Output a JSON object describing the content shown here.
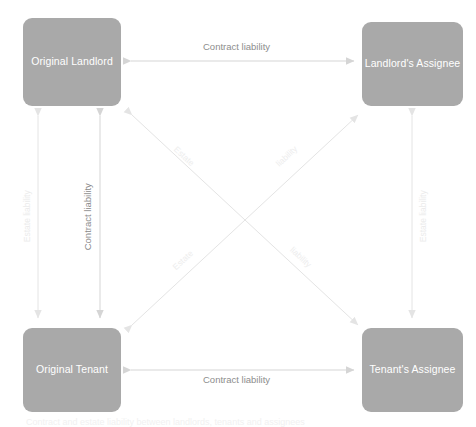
{
  "diagram": {
    "title": "Contract and estate liability between landlords, tenants and assignees",
    "background_color": "#ffffff",
    "node_fill_color": "#a9a9a9",
    "node_text_color": "#ffffff",
    "arrow_color": "#d8d8d8",
    "label_color_strong": "#8d8d8d",
    "label_color_faint": "#ebebeb",
    "nodes": [
      {
        "id": "original-landlord",
        "label": "Original Landlord",
        "position": "top-left"
      },
      {
        "id": "landlords-assignee",
        "label": "Landlord's Assignee",
        "position": "top-right"
      },
      {
        "id": "original-tenant",
        "label": "Original Tenant",
        "position": "bottom-left"
      },
      {
        "id": "tenants-assignee",
        "label": "Tenant's Assignee",
        "position": "bottom-right"
      }
    ],
    "edges": [
      {
        "id": "top-horizontal",
        "from": "original-landlord",
        "to": "landlords-assignee",
        "label": "Contract liability",
        "orientation": "horizontal",
        "double_headed": true,
        "emphasis": "strong"
      },
      {
        "id": "bottom-horizontal",
        "from": "original-tenant",
        "to": "tenants-assignee",
        "label": "Contract liability",
        "orientation": "horizontal",
        "double_headed": true,
        "emphasis": "strong"
      },
      {
        "id": "left-outer-vertical",
        "from": "original-landlord",
        "to": "original-tenant",
        "label": "Estate liability",
        "orientation": "vertical",
        "double_headed": true,
        "emphasis": "faint"
      },
      {
        "id": "left-inner-vertical",
        "from": "original-landlord",
        "to": "original-tenant",
        "label": "Contract liability",
        "orientation": "vertical",
        "double_headed": true,
        "emphasis": "strong"
      },
      {
        "id": "right-vertical",
        "from": "landlords-assignee",
        "to": "tenants-assignee",
        "label": "Estate liability",
        "orientation": "vertical",
        "double_headed": true,
        "emphasis": "faint"
      },
      {
        "id": "diagonal-landlord-tenants-assignee",
        "from": "original-landlord",
        "to": "tenants-assignee",
        "label_upper": "Estate",
        "label_lower": "liability",
        "orientation": "diagonal-down-right",
        "double_headed": true,
        "emphasis": "faint"
      },
      {
        "id": "diagonal-tenant-landlords-assignee",
        "from": "original-tenant",
        "to": "landlords-assignee",
        "label_upper": "liability",
        "label_lower": "Estate",
        "orientation": "diagonal-up-right",
        "double_headed": true,
        "emphasis": "faint"
      }
    ]
  }
}
